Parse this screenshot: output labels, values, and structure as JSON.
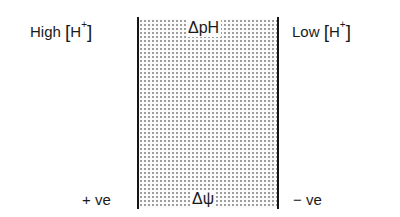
{
  "diagram": {
    "left_side": {
      "top_label": {
        "prefix": "High",
        "open_bracket": "[",
        "species": "H",
        "charge": "+",
        "close_bracket": "]"
      },
      "bottom_label": "+ ve"
    },
    "right_side": {
      "top_label": {
        "prefix": "Low",
        "open_bracket": "[",
        "species": "H",
        "charge": "+",
        "close_bracket": "]"
      },
      "bottom_label": "− ve"
    },
    "membrane": {
      "top_label": "ΔpH",
      "bottom_label": "Δψ",
      "fill": "stippled",
      "edge_color": "#151515"
    }
  }
}
